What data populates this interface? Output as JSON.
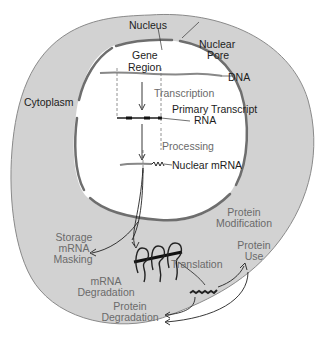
{
  "diagram": {
    "colors": {
      "cytoplasm_fill": "#d2d2d2",
      "cell_outline": "#8a8a8a",
      "nuclear_envelope": "#6e6e6e",
      "nucleus_fill": "#ffffff",
      "text_dark": "#1c1c1c",
      "text_grey": "#6a6a6a"
    },
    "regions": {
      "nucleus": "Nucleus",
      "nuclear_pore": [
        "Nuclear",
        "Pore"
      ],
      "cytoplasm": "Cytoplasm"
    },
    "nuclear_labels": {
      "gene_region": [
        "Gene",
        "Region"
      ],
      "dna": "DNA",
      "transcription": "Transcription",
      "primary_transcript": "Primary Transcript",
      "rna": "RNA",
      "processing": "Processing",
      "nuclear_mrna": "Nuclear mRNA"
    },
    "cytoplasm_labels": {
      "storage": [
        "Storage",
        "mRNA",
        "Masking"
      ],
      "mrna_degradation": [
        "mRNA",
        "Degradation"
      ],
      "translation": "Translation",
      "protein_modification": [
        "Protein",
        "Modification"
      ],
      "protein_use": [
        "Protein",
        "Use"
      ],
      "protein_degradation": [
        "Protein",
        "Degradation"
      ]
    }
  }
}
